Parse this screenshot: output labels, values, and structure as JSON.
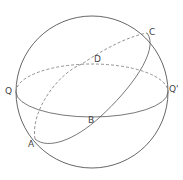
{
  "diagram": {
    "stroke_color": "#555555",
    "labels": {
      "Q": "Q",
      "Q_prime": "Q'",
      "C": "C",
      "D": "D",
      "B": "B",
      "A": "A"
    },
    "elements": [
      {
        "id": "sphere-outline",
        "type": "circle",
        "style": "solid"
      },
      {
        "id": "equator-front",
        "type": "ellipse-arc",
        "from": "Q",
        "to": "Q'",
        "via": "B",
        "style": "solid"
      },
      {
        "id": "equator-back",
        "type": "ellipse-arc",
        "from": "Q",
        "to": "Q'",
        "via": "D",
        "style": "dashed"
      },
      {
        "id": "tilted-circle-front",
        "type": "ellipse-arc",
        "from": "A",
        "to": "C",
        "via": "B",
        "style": "solid"
      },
      {
        "id": "tilted-circle-back",
        "type": "ellipse-arc",
        "from": "A",
        "to": "C",
        "via": "D",
        "style": "dashed"
      }
    ]
  }
}
